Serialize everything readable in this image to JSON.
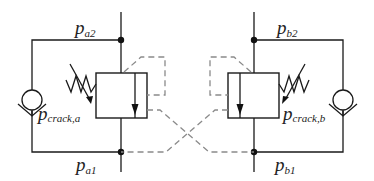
{
  "diagram": {
    "colors": {
      "line": "#1a1a1a",
      "pilot_dashed": "#8a8a8a",
      "background": "#ffffff"
    },
    "labels": {
      "pa2": {
        "main": "p",
        "sub": "a2"
      },
      "pa1": {
        "main": "p",
        "sub": "a1"
      },
      "pb2": {
        "main": "p",
        "sub": "b2"
      },
      "pb1": {
        "main": "p",
        "sub": "b1"
      },
      "pcrack_a": {
        "main": "p",
        "sub": "crack,a"
      },
      "pcrack_b": {
        "main": "p",
        "sub": "crack,b"
      }
    },
    "components": [
      {
        "id": "valve-a",
        "type": "pressure-valve",
        "spring": "adjustable",
        "side": "left"
      },
      {
        "id": "valve-b",
        "type": "pressure-valve",
        "spring": "adjustable",
        "side": "right"
      },
      {
        "id": "check-a",
        "type": "check-valve",
        "side": "left"
      },
      {
        "id": "check-b",
        "type": "check-valve",
        "side": "right"
      }
    ]
  }
}
